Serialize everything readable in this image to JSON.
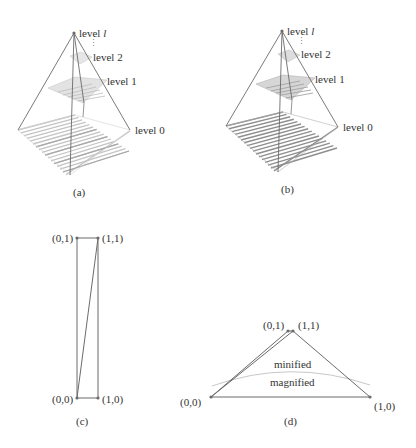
{
  "colors": {
    "line": "#6b6b6b",
    "grid_light": "#cfcfcf",
    "grid_dark": "#9a9a9a",
    "curve": "#c8c8c8",
    "text": "#333333"
  },
  "panels": {
    "a": {
      "caption": "(a)",
      "labels": {
        "level_l_prefix": "level ",
        "level_l_var": "l",
        "level_2": "level 2",
        "level_1": "level 1",
        "level_0": "level 0",
        "ellipsis": "⋮"
      },
      "style": "light-shaded mip-map pyramid"
    },
    "b": {
      "caption": "(b)",
      "labels": {
        "level_l_prefix": "level ",
        "level_l_var": "l",
        "level_2": "level 2",
        "level_1": "level 1",
        "level_0": "level 0",
        "ellipsis": "⋮"
      },
      "style": "dark-shaded mip-map pyramid"
    },
    "c": {
      "caption": "(c)",
      "corners": {
        "top_left": "(0,1)",
        "top_right": "(1,1)",
        "bottom_left": "(0,0)",
        "bottom_right": "(1,0)"
      }
    },
    "d": {
      "caption": "(d)",
      "corners": {
        "top_left": "(0,1)",
        "top_right": "(1,1)",
        "bottom_left": "(0,0)",
        "bottom_right": "(1,0)"
      },
      "regions": {
        "upper": "minified",
        "lower": "magnified"
      }
    }
  }
}
